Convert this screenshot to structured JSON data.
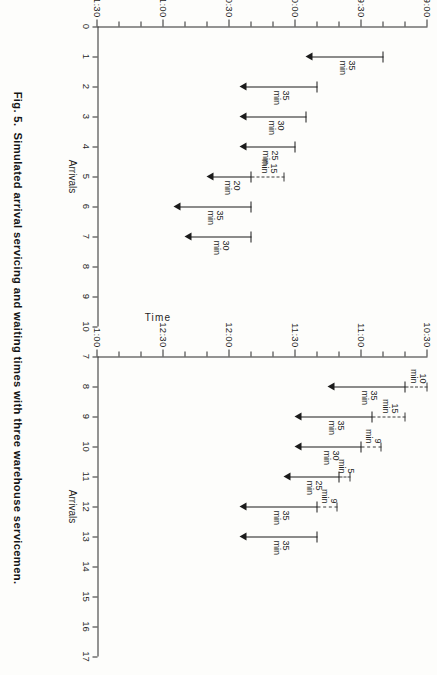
{
  "figure": {
    "number": "Fig. 5.",
    "caption": "Simulated arrival servicing and waiting times with three warehouse servicemen."
  },
  "chart_data": [
    {
      "id": "panel-a",
      "type": "bar",
      "orientation": "vertical-gantt",
      "title": "",
      "xlabel": "Arrivals",
      "ylabel": "Time",
      "x_ticks": [
        "0",
        "1",
        "2",
        "3",
        "4",
        "5",
        "6",
        "7",
        "8",
        "9",
        "10"
      ],
      "xlim": [
        0,
        10
      ],
      "y_tick_labels": [
        "9:00",
        "9:30",
        "10:00",
        "10:30",
        "11:00",
        "11:30"
      ],
      "y_minor_step_min": 10,
      "ylim_start": "9:00",
      "ylim_end": "11:30",
      "grid": false,
      "legend": "none",
      "bars": [
        {
          "arrival": 1,
          "wait_min": 0,
          "wait_label": "",
          "service_min": 35,
          "service_label": "35\nmin",
          "start": "9:20",
          "service_start": "9:20",
          "end": "9:55"
        },
        {
          "arrival": 2,
          "wait_min": 0,
          "wait_label": "",
          "service_min": 35,
          "service_label": "35\nmin",
          "start": "9:50",
          "service_start": "9:50",
          "end": "10:25"
        },
        {
          "arrival": 3,
          "wait_min": 0,
          "wait_label": "",
          "service_min": 30,
          "service_label": "30\nmin",
          "start": "9:55",
          "service_start": "9:55",
          "end": "10:25"
        },
        {
          "arrival": 4,
          "wait_min": 0,
          "wait_label": "",
          "service_min": 25,
          "service_label": "25\nmin",
          "start": "10:00",
          "service_start": "10:00",
          "end": "10:25"
        },
        {
          "arrival": 5,
          "wait_min": 15,
          "wait_label": "15\nmin",
          "service_min": 20,
          "service_label": "20\nmin",
          "start": "10:05",
          "service_start": "10:20",
          "end": "10:40"
        },
        {
          "arrival": 6,
          "wait_min": 0,
          "wait_label": "",
          "service_min": 35,
          "service_label": "35\nmin",
          "start": "10:20",
          "service_start": "10:20",
          "end": "10:55"
        },
        {
          "arrival": 7,
          "wait_min": 0,
          "wait_label": "",
          "service_min": 30,
          "service_label": "30\nmin",
          "start": "10:20",
          "service_start": "10:20",
          "end": "10:50"
        }
      ]
    },
    {
      "id": "panel-b",
      "type": "bar",
      "orientation": "vertical-gantt",
      "title": "",
      "xlabel": "Arrivals",
      "ylabel": "Time",
      "x_ticks": [
        "7",
        "8",
        "9",
        "10",
        "11",
        "12",
        "13",
        "14",
        "15",
        "16",
        "17"
      ],
      "xlim": [
        7,
        17
      ],
      "y_tick_labels": [
        "10:30",
        "11:00",
        "11:30",
        "12:00",
        "12:30",
        "1:00"
      ],
      "y_minor_step_min": 10,
      "ylim_start": "10:30",
      "ylim_end": "1:00",
      "grid": false,
      "legend": "none",
      "bars": [
        {
          "arrival": 8,
          "wait_min": 10,
          "wait_label": "10\nmin",
          "service_min": 35,
          "service_label": "35\nmin",
          "start": "10:30",
          "service_start": "10:40",
          "end": "11:15"
        },
        {
          "arrival": 9,
          "wait_min": 15,
          "wait_label": "15\nmin",
          "service_min": 35,
          "service_label": "35\nmin",
          "start": "10:40",
          "service_start": "10:55",
          "end": "11:30"
        },
        {
          "arrival": 10,
          "wait_min": 9,
          "wait_label": "9\nmin",
          "service_min": 30,
          "service_label": "30\nmin",
          "start": "10:51",
          "service_start": "11:00",
          "end": "11:30"
        },
        {
          "arrival": 11,
          "wait_min": 5,
          "wait_label": "5\nmin",
          "service_min": 25,
          "service_label": "25\nmin",
          "start": "11:05",
          "service_start": "11:10",
          "end": "11:35"
        },
        {
          "arrival": 12,
          "wait_min": 9,
          "wait_label": "9\nmin",
          "service_min": 35,
          "service_label": "35\nmin",
          "start": "11:11",
          "service_start": "11:20",
          "end": "11:55"
        },
        {
          "arrival": 13,
          "wait_min": 0,
          "wait_label": "",
          "service_min": 35,
          "service_label": "35\nmin",
          "start": "11:20",
          "service_start": "11:20",
          "end": "11:55"
        }
      ]
    }
  ]
}
